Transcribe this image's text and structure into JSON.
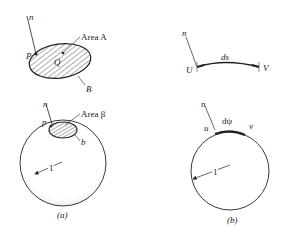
{
  "figure": {
    "panel_a": {
      "caption": "(a)",
      "flat_region": {
        "normal_label": "n",
        "point_label": "P",
        "interior_point_label": "Q",
        "area_label": "Area A",
        "boundary_label": "B"
      },
      "sphere_region": {
        "normal_label": "n",
        "point_label": "p",
        "area_label": "Area β",
        "boundary_label": "b",
        "radius_label": "1"
      }
    },
    "panel_b": {
      "caption": "(b)",
      "flat_arc": {
        "normal_label": "n",
        "start_label": "U",
        "end_label": "V",
        "length_label": "ds"
      },
      "circle_arc": {
        "normal_label": "n",
        "start_label": "u",
        "end_label": "v",
        "angle_label": "dψ",
        "radius_label": "1"
      }
    }
  }
}
